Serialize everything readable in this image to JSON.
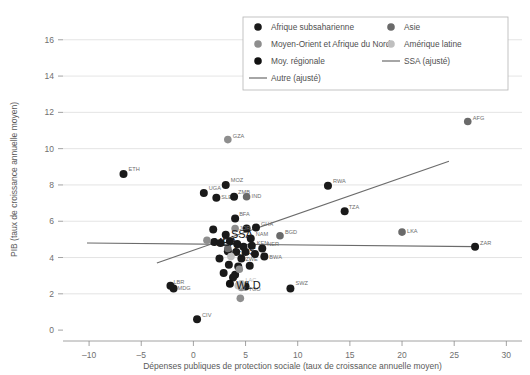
{
  "chart_data": {
    "type": "scatter",
    "title": "",
    "xlabel": "Dépenses publiques de protection sociale (taux de croissance annuelle moyen)",
    "ylabel": "PIB (taux de croissance annuelle moyen)",
    "xlim": [
      -12.5,
      31.5
    ],
    "ylim": [
      -0.6,
      17.2
    ],
    "xticks": [
      -10,
      -5,
      0,
      5,
      10,
      15,
      20,
      25,
      30
    ],
    "xtick_labels": [
      "–10",
      "–5",
      "0",
      "5",
      "10",
      "15",
      "20",
      "25",
      "30"
    ],
    "yticks": [
      0,
      2,
      4,
      6,
      8,
      10,
      12,
      14,
      16
    ],
    "ytick_labels": [
      "0",
      "2",
      "4",
      "6",
      "8",
      "10",
      "12",
      "14",
      "16"
    ],
    "grid": "horizontal",
    "legend_position": "top-center",
    "colors": {
      "ssa": "#1a1a1a",
      "mena": "#8e8e8e",
      "regional_avg": "#111111",
      "asia": "#6a6a6a",
      "latam": "#bfbfbf",
      "line_other": "#6b6b6b",
      "line_ssa": "#6b6b6b",
      "grid": "#d8d8d8",
      "axis": "#8c8c8c"
    },
    "legend": [
      {
        "key": "ssa",
        "label": "Afrique subsaharienne",
        "marker": "dot",
        "color": "#1a1a1a"
      },
      {
        "key": "asia",
        "label": "Asie",
        "marker": "dot",
        "color": "#6a6a6a"
      },
      {
        "key": "mena",
        "label": "Moyen-Orient et Afrique du Nord",
        "marker": "dot",
        "color": "#8e8e8e"
      },
      {
        "key": "latam",
        "label": "Amérique latine",
        "marker": "dot",
        "color": "#bfbfbf"
      },
      {
        "key": "regional_avg",
        "label": "Moy. régionale",
        "marker": "dot",
        "color": "#111111"
      },
      {
        "key": "line_ssa",
        "label": "SSA (ajusté)",
        "marker": "line",
        "color": "#6b6b6b"
      },
      {
        "key": "line_other",
        "label": "Autre (ajusté)",
        "marker": "line",
        "color": "#6b6b6b"
      }
    ],
    "series": [
      {
        "name": "Afrique subsaharienne",
        "group": "ssa",
        "color": "#1a1a1a",
        "points": [
          {
            "label": "ETH",
            "x": -6.7,
            "y": 8.6,
            "lx": 5,
            "ly": -3
          },
          {
            "label": "UGA",
            "x": 1.0,
            "y": 7.55,
            "lx": 5,
            "ly": -3
          },
          {
            "label": "SLE",
            "x": 2.2,
            "y": 7.3,
            "lx": 5,
            "ly": 1
          },
          {
            "label": "MOZ",
            "x": 3.1,
            "y": 8.0,
            "lx": 5,
            "ly": -3
          },
          {
            "label": "ZMB",
            "x": 3.9,
            "y": 7.35,
            "lx": 4,
            "ly": -3
          },
          {
            "label": "BFA",
            "x": 4.0,
            "y": 6.15,
            "lx": 4,
            "ly": -3
          },
          {
            "label": "GHA",
            "x": 6.0,
            "y": 5.65,
            "lx": 5,
            "ly": -2
          },
          {
            "label": "RWA",
            "x": 12.9,
            "y": 7.95,
            "lx": 5,
            "ly": -3
          },
          {
            "label": "TZA",
            "x": 14.5,
            "y": 6.55,
            "lx": 4,
            "ly": -2
          },
          {
            "label": "NAM",
            "x": 5.5,
            "y": 5.05,
            "lx": 5,
            "ly": -2
          },
          {
            "label": "KEN",
            "x": 5.6,
            "y": 4.65,
            "lx": 5,
            "ly": -1
          },
          {
            "label": "NER",
            "x": 6.6,
            "y": 4.5,
            "lx": 5,
            "ly": 0
          },
          {
            "label": "BWA",
            "x": 6.8,
            "y": 4.05,
            "lx": 5,
            "ly": 2
          },
          {
            "label": "ZWE",
            "x": 4.6,
            "y": 3.95,
            "lx": 4,
            "ly": 3
          },
          {
            "label": "SSA",
            "x": 3.1,
            "y": 5.25,
            "lx": 0,
            "ly": 0
          },
          {
            "label": "MDG",
            "x": -1.9,
            "y": 2.3,
            "lx": 4,
            "ly": 2
          },
          {
            "label": "LBR",
            "x": -2.2,
            "y": 2.45,
            "lx": 3,
            "ly": -2
          },
          {
            "label": "CIV",
            "x": 0.35,
            "y": 0.6,
            "lx": 5,
            "ly": -2
          },
          {
            "label": "SWZ",
            "x": 9.3,
            "y": 2.3,
            "lx": 5,
            "ly": -3
          },
          {
            "label": "TGO",
            "x": 5.0,
            "y": 2.4,
            "lx": 3,
            "ly": 4
          },
          {
            "label": "ZAR",
            "x": 27.0,
            "y": 4.6,
            "lx": 5,
            "ly": -2
          },
          {
            "label": "",
            "x": 2.0,
            "y": 4.85,
            "lx": 0,
            "ly": 0
          },
          {
            "label": "",
            "x": 2.6,
            "y": 4.8,
            "lx": 0,
            "ly": 0
          },
          {
            "label": "",
            "x": 3.5,
            "y": 4.9,
            "lx": 0,
            "ly": 0
          },
          {
            "label": "",
            "x": 4.2,
            "y": 4.75,
            "lx": 0,
            "ly": 0
          },
          {
            "label": "",
            "x": 4.8,
            "y": 4.6,
            "lx": 0,
            "ly": 0
          },
          {
            "label": "",
            "x": 3.3,
            "y": 4.35,
            "lx": 0,
            "ly": 0
          },
          {
            "label": "",
            "x": 4.1,
            "y": 4.3,
            "lx": 0,
            "ly": 0
          },
          {
            "label": "",
            "x": 5.0,
            "y": 4.3,
            "lx": 0,
            "ly": 0
          },
          {
            "label": "",
            "x": 5.9,
            "y": 4.2,
            "lx": 0,
            "ly": 0
          },
          {
            "label": "",
            "x": 2.5,
            "y": 3.95,
            "lx": 0,
            "ly": 0
          },
          {
            "label": "",
            "x": 3.4,
            "y": 3.6,
            "lx": 0,
            "ly": 0
          },
          {
            "label": "",
            "x": 4.3,
            "y": 3.5,
            "lx": 0,
            "ly": 0
          },
          {
            "label": "",
            "x": 5.4,
            "y": 3.55,
            "lx": 0,
            "ly": 0
          },
          {
            "label": "",
            "x": 2.9,
            "y": 3.15,
            "lx": 0,
            "ly": 0
          },
          {
            "label": "",
            "x": 4.0,
            "y": 3.05,
            "lx": 0,
            "ly": 0
          },
          {
            "label": "",
            "x": 1.9,
            "y": 5.55,
            "lx": 0,
            "ly": 0
          },
          {
            "label": "",
            "x": 5.1,
            "y": 5.6,
            "lx": 0,
            "ly": 0
          },
          {
            "label": "",
            "x": 3.8,
            "y": 2.9,
            "lx": 0,
            "ly": 0
          }
        ]
      },
      {
        "name": "Moyen-Orient et Afrique du Nord",
        "group": "mena",
        "color": "#8e8e8e",
        "points": [
          {
            "label": "GZA",
            "x": 3.3,
            "y": 10.5,
            "lx": 5,
            "ly": -2
          },
          {
            "label": "JOR",
            "x": 4.0,
            "y": 5.6,
            "lx": 4,
            "ly": 2
          },
          {
            "label": "MEA",
            "x": 1.3,
            "y": 4.95,
            "lx": 0,
            "ly": 0
          },
          {
            "label": "",
            "x": 4.4,
            "y": 3.35,
            "lx": 0,
            "ly": 0
          },
          {
            "label": "",
            "x": 4.6,
            "y": 2.35,
            "lx": 0,
            "ly": 0
          },
          {
            "label": "",
            "x": 4.5,
            "y": 1.75,
            "lx": 0,
            "ly": 0
          }
        ]
      },
      {
        "name": "Asie",
        "group": "asia",
        "color": "#6a6a6a",
        "points": [
          {
            "label": "IND",
            "x": 5.1,
            "y": 7.35,
            "lx": 5,
            "ly": 1
          },
          {
            "label": "LKA",
            "x": 20.0,
            "y": 5.4,
            "lx": 5,
            "ly": 1
          },
          {
            "label": "AFG",
            "x": 26.3,
            "y": 11.5,
            "lx": 5,
            "ly": -1
          },
          {
            "label": "BGD",
            "x": 8.3,
            "y": 5.2,
            "lx": 5,
            "ly": -2
          },
          {
            "label": "EAS",
            "x": 3.3,
            "y": 4.5,
            "lx": 0,
            "ly": 0
          }
        ]
      },
      {
        "name": "Amérique latine",
        "group": "latam",
        "color": "#bfbfbf",
        "points": [
          {
            "label": "",
            "x": 4.3,
            "y": 2.45,
            "lx": 0,
            "ly": 0
          },
          {
            "label": "LAC",
            "x": 4.6,
            "y": 2.55,
            "lx": 4,
            "ly": -2
          },
          {
            "label": "",
            "x": 3.6,
            "y": 4.05,
            "lx": 0,
            "ly": 0
          }
        ]
      },
      {
        "name": "Moy. régionale",
        "group": "regional_avg",
        "color": "#111111",
        "points": [
          {
            "label": "WLD",
            "x": 3.5,
            "y": 2.55,
            "lx": 0,
            "ly": 0
          }
        ]
      }
    ],
    "big_labels": [
      {
        "text": "SSA",
        "x": 3.6,
        "y": 5.3
      },
      {
        "text": "MEA",
        "x": 1.9,
        "y": 4.85
      },
      {
        "text": "EAS",
        "x": 3.9,
        "y": 4.35
      },
      {
        "text": "WLD",
        "x": 4.1,
        "y": 2.5
      }
    ],
    "lines": [
      {
        "name": "SSA (ajusté)",
        "key": "line_ssa",
        "color": "#6b6b6b",
        "x0": -3.5,
        "y0": 3.7,
        "x1": 24.5,
        "y1": 9.3
      },
      {
        "name": "Autre (ajusté)",
        "key": "line_other",
        "color": "#6b6b6b",
        "x0": -10.2,
        "y0": 4.8,
        "x1": 27.0,
        "y1": 4.6
      }
    ]
  }
}
